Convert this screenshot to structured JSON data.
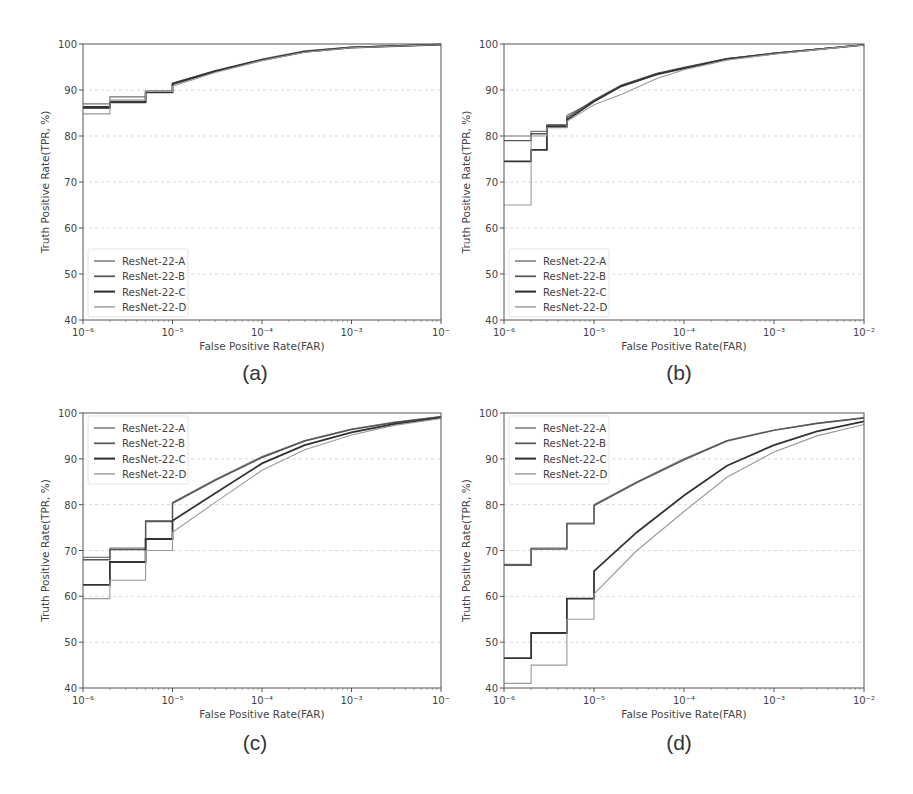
{
  "figure": {
    "panels": [
      "(a)",
      "(b)",
      "(c)",
      "(d)"
    ]
  },
  "chart_data": [
    {
      "type": "line",
      "panel": "(a)",
      "title": "",
      "xlabel": "False Positive Rate(FAR)",
      "ylabel": "Truth Positive Rate(TPR, %)",
      "xscale": "log",
      "xlim": [
        1e-06,
        0.01
      ],
      "ylim": [
        40,
        100
      ],
      "xticks": [
        "10^-6",
        "10^-5",
        "10^-4",
        "10^-3",
        "10^-2"
      ],
      "xtick_labels_visible": [
        "10⁻⁶",
        "10⁻⁵",
        "10⁻⁴",
        "10⁻³",
        "10⁻"
      ],
      "yticks": [
        40,
        50,
        60,
        70,
        80,
        90,
        100
      ],
      "grid": "horizontal dashed",
      "legend_position": "lower left",
      "x": [
        1e-06,
        2e-06,
        5e-06,
        1e-05,
        3e-05,
        0.0001,
        0.0003,
        0.001,
        0.01
      ],
      "series": [
        {
          "name": "ResNet-22-A",
          "values": [
            87.0,
            88.5,
            89.8,
            91.5,
            94.2,
            96.7,
            98.5,
            99.3,
            99.9
          ]
        },
        {
          "name": "ResNet-22-B",
          "values": [
            86.0,
            87.5,
            89.6,
            91.2,
            94.0,
            96.6,
            98.4,
            99.3,
            99.9
          ]
        },
        {
          "name": "ResNet-22-C",
          "values": [
            86.3,
            87.3,
            89.5,
            91.4,
            94.1,
            96.5,
            98.3,
            99.2,
            99.9
          ]
        },
        {
          "name": "ResNet-22-D",
          "values": [
            84.8,
            87.8,
            89.7,
            90.8,
            93.8,
            96.4,
            98.2,
            99.2,
            99.9
          ]
        }
      ]
    },
    {
      "type": "line",
      "panel": "(b)",
      "title": "",
      "xlabel": "False Positive Rate(FAR)",
      "ylabel": "Truth Positive Rate(TPR, %)",
      "xscale": "log",
      "xlim": [
        1e-06,
        0.01
      ],
      "ylim": [
        40,
        100
      ],
      "xticks": [
        "10^-6",
        "10^-5",
        "10^-4",
        "10^-3",
        "10^-2"
      ],
      "xtick_labels_visible": [
        "10⁻⁶",
        "10⁻⁵",
        "10⁻⁴",
        "10⁻³",
        "10⁻²"
      ],
      "yticks": [
        40,
        50,
        60,
        70,
        80,
        90,
        100
      ],
      "grid": "horizontal dashed",
      "legend_position": "lower left",
      "x": [
        1e-06,
        2e-06,
        3e-06,
        5e-06,
        1e-05,
        2e-05,
        5e-05,
        0.0001,
        0.0003,
        0.001,
        0.01
      ],
      "series": [
        {
          "name": "ResNet-22-A",
          "values": [
            80.0,
            81.0,
            82.5,
            84.5,
            87.5,
            91.0,
            93.5,
            94.8,
            96.8,
            98.0,
            99.8
          ]
        },
        {
          "name": "ResNet-22-B",
          "values": [
            79.0,
            80.5,
            82.3,
            84.0,
            87.8,
            91.0,
            93.6,
            94.9,
            96.8,
            98.0,
            99.8
          ]
        },
        {
          "name": "ResNet-22-C",
          "values": [
            74.5,
            77.0,
            82.0,
            83.5,
            87.5,
            90.8,
            93.4,
            94.7,
            96.7,
            97.9,
            99.8
          ]
        },
        {
          "name": "ResNet-22-D",
          "values": [
            65.0,
            80.0,
            81.8,
            83.2,
            86.8,
            89.0,
            92.5,
            94.4,
            96.5,
            97.8,
            99.8
          ]
        }
      ]
    },
    {
      "type": "line",
      "panel": "(c)",
      "title": "",
      "xlabel": "False Positive Rate(FAR)",
      "ylabel": "Truth Positive Rate(TPR, %)",
      "xscale": "log",
      "xlim": [
        1e-06,
        0.01
      ],
      "ylim": [
        40,
        100
      ],
      "xticks": [
        "10^-6",
        "10^-5",
        "10^-4",
        "10^-3",
        "10^-2"
      ],
      "xtick_labels_visible": [
        "10⁻⁶",
        "10⁻⁵",
        "10⁻⁴",
        "10⁻³",
        "10⁻"
      ],
      "yticks": [
        40,
        50,
        60,
        70,
        80,
        90,
        100
      ],
      "grid": "horizontal dashed",
      "legend_position": "upper left",
      "x": [
        1e-06,
        2e-06,
        5e-06,
        1e-05,
        3e-05,
        0.0001,
        0.0003,
        0.001,
        0.003,
        0.01
      ],
      "series": [
        {
          "name": "ResNet-22-A",
          "values": [
            68.5,
            70.5,
            76.5,
            80.5,
            85.5,
            90.5,
            94.0,
            96.5,
            98.0,
            99.2
          ]
        },
        {
          "name": "ResNet-22-B",
          "values": [
            68.0,
            70.2,
            76.3,
            80.3,
            85.3,
            90.3,
            93.9,
            96.4,
            97.9,
            99.2
          ]
        },
        {
          "name": "ResNet-22-C",
          "values": [
            62.5,
            67.5,
            72.5,
            76.5,
            82.5,
            89.0,
            93.0,
            95.8,
            97.6,
            99.0
          ]
        },
        {
          "name": "ResNet-22-D",
          "values": [
            59.5,
            63.5,
            70.0,
            74.0,
            80.5,
            87.5,
            92.0,
            95.2,
            97.3,
            98.8
          ]
        }
      ]
    },
    {
      "type": "line",
      "panel": "(d)",
      "title": "",
      "xlabel": "False Positive Rate(FAR)",
      "ylabel": "Truth Positive Rate(TPR, %)",
      "xscale": "log",
      "xlim": [
        1e-06,
        0.01
      ],
      "ylim": [
        40,
        100
      ],
      "xticks": [
        "10^-6",
        "10^-5",
        "10^-4",
        "10^-3",
        "10^-2"
      ],
      "xtick_labels_visible": [
        "10⁻⁶",
        "10⁻⁵",
        "10⁻⁴",
        "10⁻³",
        "10⁻²"
      ],
      "yticks": [
        40,
        50,
        60,
        70,
        80,
        90,
        100
      ],
      "grid": "horizontal dashed",
      "legend_position": "upper left",
      "x": [
        1e-06,
        2e-06,
        5e-06,
        1e-05,
        3e-05,
        0.0001,
        0.0003,
        0.001,
        0.003,
        0.01
      ],
      "series": [
        {
          "name": "ResNet-22-A",
          "values": [
            67.0,
            70.5,
            76.0,
            80.0,
            85.0,
            90.0,
            94.0,
            96.3,
            97.8,
            99.0
          ]
        },
        {
          "name": "ResNet-22-B",
          "values": [
            66.8,
            70.3,
            75.8,
            79.8,
            84.8,
            89.8,
            93.9,
            96.2,
            97.7,
            98.9
          ]
        },
        {
          "name": "ResNet-22-C",
          "values": [
            46.5,
            52.0,
            59.5,
            65.5,
            74.0,
            82.0,
            88.5,
            93.0,
            96.0,
            98.2
          ]
        },
        {
          "name": "ResNet-22-D",
          "values": [
            41.0,
            45.0,
            55.0,
            60.5,
            70.0,
            78.5,
            86.0,
            91.5,
            95.0,
            97.5
          ]
        }
      ]
    }
  ],
  "legend": {
    "entries": [
      "ResNet-22-A",
      "ResNet-22-B",
      "ResNet-22-C",
      "ResNet-22-D"
    ],
    "colors": [
      "#777777",
      "#555555",
      "#333333",
      "#999999"
    ],
    "widths": [
      1.2,
      1.4,
      1.8,
      1.1
    ]
  },
  "axis_text": {
    "xlabel": "False Positive Rate(FAR)",
    "ylabel": "Truth Positive Rate(TPR, %)"
  }
}
